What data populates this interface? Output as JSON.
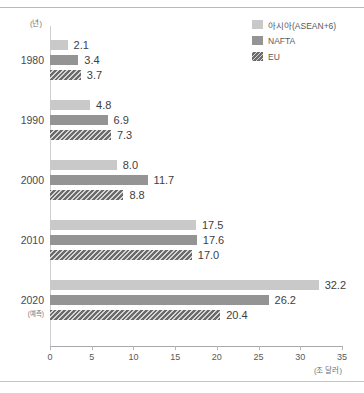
{
  "chart_data": {
    "type": "bar",
    "orientation": "horizontal",
    "title": "",
    "xlabel": "(조 달러)",
    "ylabel": "(년)",
    "categories": [
      "1980",
      "1990",
      "2000",
      "2010",
      "2020"
    ],
    "category_sublabels": [
      "",
      "",
      "",
      "",
      "(예측)"
    ],
    "series": [
      {
        "name": "아시아(ASEAN+6)",
        "color": "#c9c9c9",
        "values": [
          2.1,
          4.8,
          8.0,
          17.5,
          32.2
        ]
      },
      {
        "name": "NAFTA",
        "color": "#949494",
        "values": [
          3.4,
          6.9,
          11.7,
          17.6,
          26.2
        ]
      },
      {
        "name": "EU",
        "color": "#6b6b6b",
        "values": [
          3.7,
          7.3,
          8.8,
          17.0,
          20.4
        ]
      }
    ],
    "value_labels": [
      [
        "2.1",
        "3.4",
        "3.7"
      ],
      [
        "4.8",
        "6.9",
        "7.3"
      ],
      [
        "8.0",
        "11.7",
        "8.8"
      ],
      [
        "17.5",
        "17.6",
        "17.0"
      ],
      [
        "32.2",
        "26.2",
        "20.4"
      ]
    ],
    "xlim": [
      0,
      35
    ],
    "xticks": [
      0,
      5,
      10,
      15,
      20,
      25,
      30,
      35
    ],
    "xticklabels": [
      "0",
      "5",
      "10",
      "15",
      "20",
      "25",
      "30",
      "35"
    ],
    "grid": false,
    "legend_position": "top-right"
  },
  "legend": {
    "items": [
      {
        "label": "아시아(ASEAN+6)",
        "swatch": "s0"
      },
      {
        "label": "NAFTA",
        "swatch": "s1"
      },
      {
        "label": "EU",
        "swatch": "s2"
      }
    ]
  }
}
